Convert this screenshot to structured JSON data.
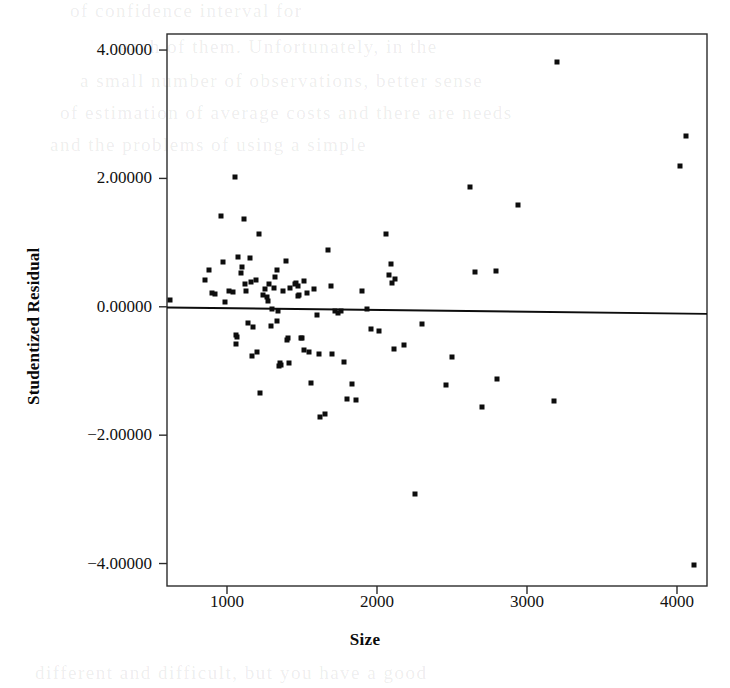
{
  "chart_data": {
    "type": "scatter",
    "title": "",
    "xlabel": "Size",
    "ylabel": "Studentized Residual",
    "xlim": [
      600,
      4200
    ],
    "ylim": [
      -4.35,
      4.25
    ],
    "grid": false,
    "legend": null,
    "xticks": [
      1000,
      2000,
      3000,
      4000
    ],
    "xtick_labels": [
      "1000",
      "2000",
      "3000",
      "4000"
    ],
    "yticks": [
      4,
      2,
      0,
      -2,
      -4
    ],
    "ytick_labels": [
      "4.00000",
      "2.00000",
      "0.00000",
      "-2.00000",
      "-4.00000"
    ],
    "reference_line": {
      "name": "lowess-fit-line",
      "x": [
        600,
        4200
      ],
      "y": [
        -0.01,
        -0.11
      ],
      "color": "#0d0d0d"
    },
    "series": [
      {
        "name": "Studentized residuals vs Size",
        "marker": "square",
        "color": "#0d0d0d",
        "points": [
          [
            620,
            0.11
          ],
          [
            850,
            0.42
          ],
          [
            880,
            0.57
          ],
          [
            900,
            0.21
          ],
          [
            920,
            0.2
          ],
          [
            960,
            1.41
          ],
          [
            975,
            0.7
          ],
          [
            985,
            0.07
          ],
          [
            1010,
            0.24
          ],
          [
            1040,
            0.23
          ],
          [
            1055,
            2.02
          ],
          [
            1060,
            -0.44
          ],
          [
            1065,
            -0.47
          ],
          [
            1060,
            -0.58
          ],
          [
            1075,
            0.78
          ],
          [
            1090,
            0.52
          ],
          [
            1100,
            0.62
          ],
          [
            1115,
            1.37
          ],
          [
            1120,
            0.36
          ],
          [
            1125,
            0.24
          ],
          [
            1140,
            -0.25
          ],
          [
            1150,
            0.76
          ],
          [
            1160,
            0.38
          ],
          [
            1165,
            -0.76
          ],
          [
            1175,
            -0.32
          ],
          [
            1190,
            0.42
          ],
          [
            1200,
            -0.71
          ],
          [
            1215,
            1.14
          ],
          [
            1220,
            -1.34
          ],
          [
            1240,
            0.19
          ],
          [
            1250,
            0.27
          ],
          [
            1265,
            0.16
          ],
          [
            1270,
            0.09
          ],
          [
            1280,
            0.35
          ],
          [
            1290,
            -0.3
          ],
          [
            1300,
            -0.04
          ],
          [
            1310,
            0.29
          ],
          [
            1320,
            0.46
          ],
          [
            1330,
            -0.22
          ],
          [
            1335,
            0.58
          ],
          [
            1340,
            -0.07
          ],
          [
            1345,
            -0.92
          ],
          [
            1350,
            -0.88
          ],
          [
            1360,
            -0.9
          ],
          [
            1375,
            0.24
          ],
          [
            1390,
            0.72
          ],
          [
            1400,
            -0.51
          ],
          [
            1405,
            -0.48
          ],
          [
            1410,
            -0.88
          ],
          [
            1420,
            0.3
          ],
          [
            1450,
            0.35
          ],
          [
            1460,
            0.37
          ],
          [
            1470,
            0.33
          ],
          [
            1475,
            0.17
          ],
          [
            1480,
            0.19
          ],
          [
            1490,
            -0.49
          ],
          [
            1500,
            -0.48
          ],
          [
            1510,
            0.4
          ],
          [
            1515,
            -0.67
          ],
          [
            1530,
            0.22
          ],
          [
            1545,
            -0.7
          ],
          [
            1560,
            -1.19
          ],
          [
            1580,
            0.27
          ],
          [
            1600,
            -0.13
          ],
          [
            1610,
            -0.74
          ],
          [
            1620,
            -1.72
          ],
          [
            1650,
            -1.67
          ],
          [
            1670,
            0.89
          ],
          [
            1690,
            0.33
          ],
          [
            1700,
            -0.73
          ],
          [
            1720,
            -0.06
          ],
          [
            1740,
            -0.09
          ],
          [
            1760,
            -0.07
          ],
          [
            1780,
            -0.86
          ],
          [
            1800,
            -1.44
          ],
          [
            1830,
            -1.21
          ],
          [
            1860,
            -1.45
          ],
          [
            1900,
            0.25
          ],
          [
            1930,
            -0.03
          ],
          [
            1960,
            -0.34
          ],
          [
            2010,
            -0.37
          ],
          [
            2060,
            1.13
          ],
          [
            2080,
            0.49
          ],
          [
            2090,
            0.66
          ],
          [
            2100,
            0.37
          ],
          [
            2110,
            -0.65
          ],
          [
            2120,
            0.44
          ],
          [
            2180,
            -0.6
          ],
          [
            2250,
            -2.92
          ],
          [
            2300,
            -0.27
          ],
          [
            2460,
            -1.22
          ],
          [
            2500,
            -0.79
          ],
          [
            2620,
            1.86
          ],
          [
            2650,
            0.54
          ],
          [
            2700,
            -1.56
          ],
          [
            2790,
            0.55
          ],
          [
            2800,
            -1.12
          ],
          [
            2940,
            1.59
          ],
          [
            3180,
            -1.46
          ],
          [
            3200,
            3.82
          ],
          [
            4020,
            2.2
          ],
          [
            4060,
            2.66
          ],
          [
            4110,
            -4.03
          ]
        ]
      }
    ]
  },
  "bleed_text": {
    "lines": [
      {
        "text": "of confidence interval for",
        "x": 70,
        "y": 0
      },
      {
        "text": "each of them. Unfortunately, in the",
        "x": 120,
        "y": 36
      },
      {
        "text": "a small number of observations, better sense",
        "x": 80,
        "y": 70
      },
      {
        "text": "of estimation of average costs and there are needs",
        "x": 60,
        "y": 102
      },
      {
        "text": "and the problems of using a simple",
        "x": 50,
        "y": 134
      },
      {
        "text": "different and difficult, but you have a good",
        "x": 35,
        "y": 662
      }
    ]
  }
}
